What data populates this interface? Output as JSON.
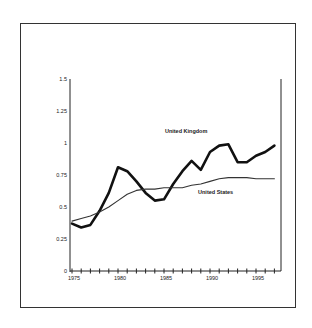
{
  "chart_data": {
    "type": "line",
    "title": "",
    "xlabel": "",
    "ylabel": "",
    "x": [
      1975,
      1976,
      1977,
      1978,
      1979,
      1980,
      1981,
      1982,
      1983,
      1984,
      1985,
      1986,
      1987,
      1988,
      1989,
      1990,
      1991,
      1992,
      1993,
      1994,
      1995,
      1996,
      1997
    ],
    "xlim": [
      1975,
      1997.5
    ],
    "ylim": [
      0,
      1.5
    ],
    "x_tick_labels": [
      "1975",
      "1980",
      "1985",
      "1990",
      "1995"
    ],
    "x_tick_values": [
      1975,
      1980,
      1985,
      1990,
      1995
    ],
    "y_tick_labels": [
      "0",
      "0.25",
      "0.5",
      "0.75",
      "1",
      "1.25",
      "1.5"
    ],
    "y_tick_values": [
      0,
      0.25,
      0.5,
      0.75,
      1,
      1.25,
      1.5
    ],
    "grid": false,
    "legend": "inline annotations",
    "series": [
      {
        "name": "United Kingdom",
        "style": "thick",
        "color": "#111111",
        "values": [
          0.37,
          0.34,
          0.36,
          0.47,
          0.61,
          0.81,
          0.78,
          0.7,
          0.61,
          0.55,
          0.56,
          0.68,
          0.78,
          0.86,
          0.79,
          0.93,
          0.98,
          0.99,
          0.85,
          0.85,
          0.9,
          0.93,
          0.98
        ],
        "label_pos": {
          "x": 1985.1,
          "y": 1.08
        }
      },
      {
        "name": "United States",
        "style": "thin",
        "color": "#333333",
        "values": [
          0.39,
          0.41,
          0.43,
          0.46,
          0.5,
          0.55,
          0.6,
          0.63,
          0.64,
          0.64,
          0.65,
          0.65,
          0.65,
          0.67,
          0.68,
          0.7,
          0.72,
          0.73,
          0.73,
          0.73,
          0.72,
          0.72,
          0.72
        ],
        "label_pos": {
          "x": 1988.7,
          "y": 0.605
        }
      }
    ]
  }
}
